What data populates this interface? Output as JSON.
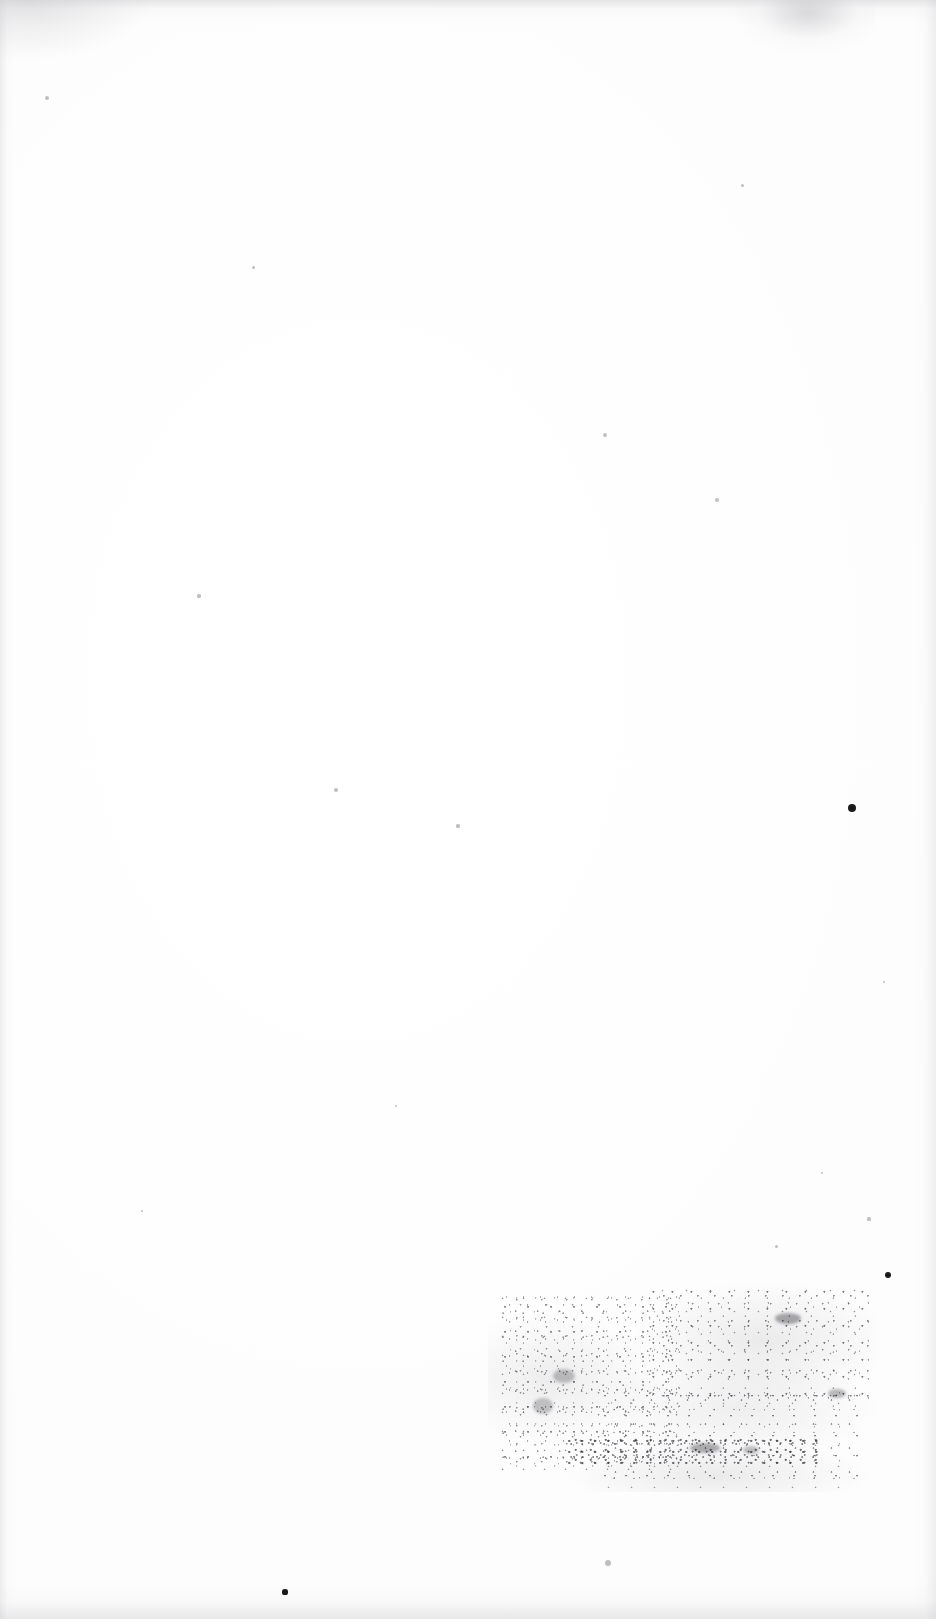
{
  "document": {
    "kind": "scanned-page",
    "description": "Blank scanned book page (verso) with faded offset ink smudge",
    "page_width": 936,
    "page_height": 1619,
    "background_color": "#ffffff",
    "paper_tone": "#fefefe",
    "ink_color": "#3a3a42",
    "legible_text": "",
    "text_blocks": []
  },
  "artifacts": {
    "scan_edges": [
      {
        "name": "top-edge",
        "color": "#cdcdd0"
      },
      {
        "name": "bottom-edge",
        "color": "#cececd"
      },
      {
        "name": "left-edge",
        "color": "#d2d2d5"
      },
      {
        "name": "right-edge",
        "color": "#d0d0d4"
      },
      {
        "name": "top-left-corner",
        "color": "#c6c6ca"
      },
      {
        "name": "top-smudge",
        "color": "#aaaab0"
      }
    ],
    "ink_smudge": {
      "name": "offset-ink-stamp",
      "left": 488,
      "top": 1282,
      "width": 392,
      "height": 210,
      "color": "#3a3a42",
      "legible": false
    },
    "specks": [
      {
        "x": 852,
        "y": 808,
        "r": 4.2,
        "tone": "dark"
      },
      {
        "x": 888,
        "y": 1275,
        "r": 3.4,
        "tone": "dark"
      },
      {
        "x": 285,
        "y": 1592,
        "r": 2.6,
        "tone": "dark"
      },
      {
        "x": 605,
        "y": 435,
        "r": 2.0,
        "tone": "soft"
      },
      {
        "x": 608,
        "y": 1563,
        "r": 3.0,
        "tone": "soft"
      },
      {
        "x": 47,
        "y": 98,
        "r": 2.2,
        "tone": "soft"
      },
      {
        "x": 717,
        "y": 500,
        "r": 2.0,
        "tone": "soft"
      },
      {
        "x": 336,
        "y": 790,
        "r": 1.8,
        "tone": "soft"
      },
      {
        "x": 458,
        "y": 826,
        "r": 1.6,
        "tone": "soft"
      },
      {
        "x": 199,
        "y": 596,
        "r": 1.6,
        "tone": "soft"
      },
      {
        "x": 253,
        "y": 267,
        "r": 1.5,
        "tone": "soft"
      },
      {
        "x": 742,
        "y": 185,
        "r": 1.5,
        "tone": "soft"
      },
      {
        "x": 869,
        "y": 1219,
        "r": 1.6,
        "tone": "soft"
      },
      {
        "x": 776,
        "y": 1246,
        "r": 1.5,
        "tone": "soft"
      },
      {
        "x": 822,
        "y": 1173,
        "r": 1.4,
        "tone": "soft"
      },
      {
        "x": 142,
        "y": 1211,
        "r": 1.4,
        "tone": "soft"
      },
      {
        "x": 884,
        "y": 982,
        "r": 1.4,
        "tone": "soft"
      },
      {
        "x": 396,
        "y": 1106,
        "r": 1.3,
        "tone": "soft"
      }
    ],
    "ink_knots": [
      {
        "x": 775,
        "y": 1313,
        "w": 26,
        "h": 11,
        "opacity": 0.42
      },
      {
        "x": 828,
        "y": 1389,
        "w": 18,
        "h": 9,
        "opacity": 0.34
      },
      {
        "x": 690,
        "y": 1443,
        "w": 30,
        "h": 10,
        "opacity": 0.4
      },
      {
        "x": 553,
        "y": 1369,
        "w": 22,
        "h": 14,
        "opacity": 0.3
      },
      {
        "x": 533,
        "y": 1398,
        "w": 20,
        "h": 16,
        "opacity": 0.28
      },
      {
        "x": 743,
        "y": 1446,
        "w": 16,
        "h": 8,
        "opacity": 0.3
      }
    ]
  }
}
